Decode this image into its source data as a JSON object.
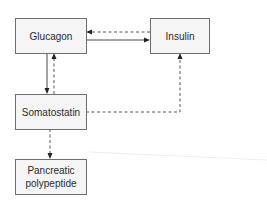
{
  "diagram": {
    "nodes": [
      {
        "id": "glucagon",
        "label": "Glucagon"
      },
      {
        "id": "insulin",
        "label": "Insulin"
      },
      {
        "id": "somatostatin",
        "label": "Somatostatin"
      },
      {
        "id": "pancreatic_polypeptide",
        "label_lines": [
          "Pancreatic",
          "polypeptide"
        ]
      }
    ],
    "edges": [
      {
        "from": "glucagon",
        "to": "insulin",
        "style": "solid"
      },
      {
        "from": "insulin",
        "to": "glucagon",
        "style": "dashed"
      },
      {
        "from": "glucagon",
        "to": "somatostatin",
        "style": "solid"
      },
      {
        "from": "somatostatin",
        "to": "glucagon",
        "style": "dashed"
      },
      {
        "from": "somatostatin",
        "to": "insulin",
        "style": "dashed"
      },
      {
        "from": "somatostatin",
        "to": "pancreatic_polypeptide",
        "style": "dashed"
      }
    ]
  }
}
